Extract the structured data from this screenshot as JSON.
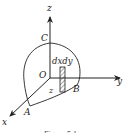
{
  "figure": {
    "labels": {
      "z_axis": "z",
      "y_axis": "y",
      "x_axis": "x",
      "origin": "O",
      "point_a": "A",
      "point_b": "B",
      "point_c": "C",
      "element": "dxdy",
      "height": "z"
    },
    "caption": "Figure 5.1",
    "colors": {
      "stroke": "#222222",
      "background": "#ffffff"
    }
  }
}
